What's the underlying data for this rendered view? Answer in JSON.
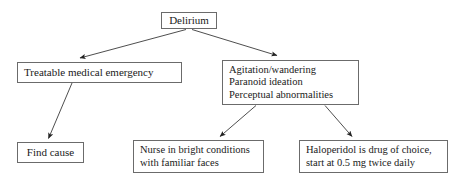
{
  "diagram": {
    "background_color": "#ffffff",
    "border_color": "#6b6b6b",
    "line_color": "#3a3a3a",
    "nodes": {
      "delirium": {
        "label": "Delirium",
        "lines": [
          "Delirium"
        ]
      },
      "treatable": {
        "label": "Treatable medical emergency",
        "lines": [
          "Treatable medical emergency"
        ]
      },
      "symptoms": {
        "label": "Agitation/wandering; Paranoid ideation; Perceptual abnormalities",
        "lines": [
          "Agitation/wandering",
          "Paranoid ideation",
          "Perceptual abnormalities"
        ]
      },
      "find_cause": {
        "label": "Find cause",
        "lines": [
          "Find cause"
        ]
      },
      "nurse": {
        "label": "Nurse in bright conditions with familiar faces",
        "lines": [
          "Nurse in bright conditions",
          "with familiar faces"
        ]
      },
      "haloperidol": {
        "label": "Haloperidol is drug of choice, start at 0.5 mg twice daily",
        "lines": [
          "Haloperidol is drug of choice,",
          "start at 0.5 mg twice daily"
        ]
      }
    },
    "edges": [
      {
        "name": "delirium-to-treatable",
        "from": "delirium",
        "to": "treatable"
      },
      {
        "name": "delirium-to-symptoms",
        "from": "delirium",
        "to": "symptoms"
      },
      {
        "name": "treatable-to-find-cause",
        "from": "treatable",
        "to": "find_cause"
      },
      {
        "name": "symptoms-to-nurse",
        "from": "symptoms",
        "to": "nurse"
      },
      {
        "name": "symptoms-to-haloperidol",
        "from": "symptoms",
        "to": "haloperidol"
      }
    ]
  }
}
